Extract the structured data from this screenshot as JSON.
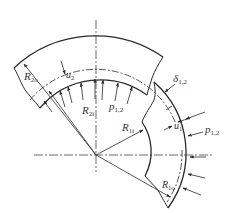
{
  "diagram": {
    "type": "shrink-fit compound cylinder cross-section",
    "colors": {
      "line": "#2a2a2a",
      "background": "#ffffff"
    },
    "labels": {
      "R2o": {
        "main": "R",
        "sub": "2o"
      },
      "R2i": {
        "main": "R",
        "sub": "2i"
      },
      "R1i": {
        "main": "R",
        "sub": "1i"
      },
      "R1o": {
        "main": "R",
        "sub": "1o"
      },
      "u2": {
        "main": "u",
        "sub": "2"
      },
      "u1": {
        "main": "u",
        "sub": "1"
      },
      "p12_inner": {
        "main": "p",
        "sub": "1,2"
      },
      "p12_outer": {
        "main": "p",
        "sub": "1,2"
      },
      "delta12": {
        "main": "δ",
        "sub": "1,2"
      }
    }
  }
}
